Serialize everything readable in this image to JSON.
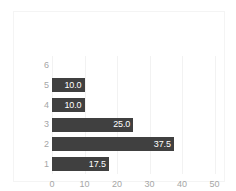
{
  "chart_data": {
    "type": "bar",
    "orientation": "horizontal",
    "title": "",
    "subtitle": "",
    "xlabel": "",
    "ylabel": "",
    "categories": [
      "6",
      "5",
      "4",
      "3",
      "2",
      "1"
    ],
    "values": [
      0,
      10.0,
      10.0,
      25.0,
      37.5,
      17.5
    ],
    "data_labels": [
      "",
      "10.0",
      "10.0",
      "25.0",
      "37.5",
      "17.5"
    ],
    "xlim": [
      0,
      52
    ],
    "ylim": null,
    "xticks": [
      0,
      10,
      20,
      30,
      40,
      50
    ],
    "xtick_labels": [
      "0",
      "10",
      "20",
      "30",
      "40",
      "50"
    ],
    "ytick_labels": [
      "6",
      "5",
      "4",
      "3",
      "2",
      "1"
    ],
    "grid": true,
    "grid_axis": "x",
    "legend": false,
    "legend_position": "none",
    "annotations": []
  },
  "style": {
    "bar_color": "#404040",
    "data_label_color": "#ffffff",
    "tick_label_color": "#a6a6a6",
    "gridline_color": "#f2f2f2",
    "frame_color": "#f4f4f4",
    "background_color": "#ffffff"
  }
}
